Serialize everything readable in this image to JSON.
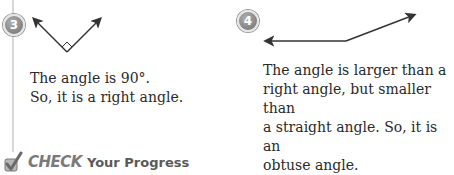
{
  "examples": [
    {
      "number": "3",
      "figure": "right-angle",
      "lines": [
        "The angle is 90°.",
        "So, it is a right angle."
      ]
    },
    {
      "number": "4",
      "figure": "obtuse-angle",
      "lines": [
        "The angle is larger than a",
        "right angle, but smaller than",
        "a straight angle. So, it is an",
        "obtuse angle."
      ]
    }
  ],
  "footer": {
    "check_label": "CHECK",
    "progress_label": "Your Progress"
  },
  "colors": {
    "badge": "#8a8a8a",
    "text": "#2a2a2a",
    "rule": "#d8d8d8"
  }
}
